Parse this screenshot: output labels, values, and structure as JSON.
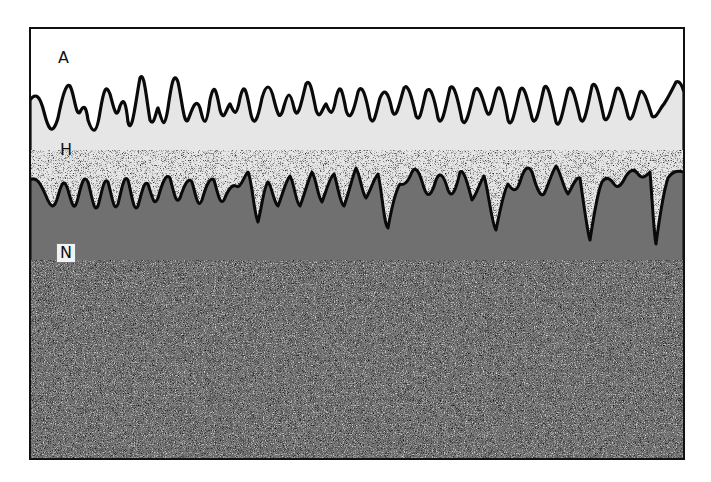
{
  "figure": {
    "layers": [
      {
        "id": "A",
        "label": "A",
        "description": "upper clear layer"
      },
      {
        "id": "H",
        "label": "H",
        "description": "middle light-stippled layer"
      },
      {
        "id": "N",
        "label": "N",
        "description": "lower dense-stippled layer"
      }
    ],
    "colors": {
      "background": "#ffffff",
      "frame": "#111111",
      "layer_a": "#ffffff",
      "layer_h": "#e4e4e4",
      "layer_n": "#6e6e6e",
      "boundary_line": "#0a0a0a"
    }
  }
}
